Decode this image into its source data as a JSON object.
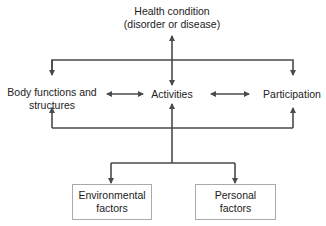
{
  "diagram": {
    "nodes": {
      "health_condition": {
        "line1": "Health condition",
        "line2": "(disorder or disease)"
      },
      "body_functions": {
        "line1": "Body functions and",
        "line2": "structures"
      },
      "activities": {
        "label": "Activities"
      },
      "participation": {
        "label": "Participation"
      },
      "environmental": {
        "line1": "Environmental",
        "line2": "factors"
      },
      "personal": {
        "line1": "Personal",
        "line2": "factors"
      }
    },
    "edges": [
      {
        "from": "health_condition",
        "to": "activities",
        "type": "bidirectional"
      },
      {
        "from": "health_condition",
        "to": "body_functions",
        "type": "directed"
      },
      {
        "from": "health_condition",
        "to": "participation",
        "type": "directed"
      },
      {
        "from": "body_functions",
        "to": "activities",
        "type": "bidirectional"
      },
      {
        "from": "activities",
        "to": "participation",
        "type": "bidirectional"
      },
      {
        "from": "contextual_hub",
        "to": "body_functions",
        "type": "directed"
      },
      {
        "from": "contextual_hub",
        "to": "activities",
        "type": "directed"
      },
      {
        "from": "contextual_hub",
        "to": "participation",
        "type": "directed"
      },
      {
        "from": "contextual_hub",
        "to": "environmental",
        "type": "directed"
      },
      {
        "from": "contextual_hub",
        "to": "personal",
        "type": "directed"
      }
    ],
    "colors": {
      "line": "#4a4a4a",
      "text": "#222222",
      "box_border": "#aaaaaa"
    }
  }
}
